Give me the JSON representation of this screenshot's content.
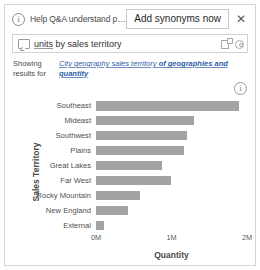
{
  "banner": {
    "info_icon": "info-icon",
    "message": "Help Q&A understand peo...",
    "add_synonyms_label": "Add synonyms now",
    "close_label": "✕"
  },
  "question_box": {
    "lead_icon": "question-box-icon",
    "term_units": "units",
    "term_connector": " by ",
    "term_territory": "sales territory",
    "visual_icon": "visual-type-icon",
    "settings_icon": "gear-icon"
  },
  "showing_results": {
    "label": "Showing results for",
    "phrase_prefix": "City geography sales territory ",
    "phrase_bold": "of geographies and quantity"
  },
  "chart_info_icon": "info-icon",
  "chart_data": {
    "type": "bar",
    "orientation": "horizontal",
    "title": "",
    "xlabel": "Quantity",
    "ylabel": "Sales Territory",
    "categories": [
      "Southeast",
      "Mideast",
      "Southwest",
      "Plains",
      "Great Lakes",
      "Far West",
      "Rocky Mountain",
      "New England",
      "External"
    ],
    "values": [
      1900000,
      1300000,
      1200000,
      1160000,
      870000,
      990000,
      580000,
      420000,
      110000
    ],
    "xlim": [
      0,
      2000000
    ],
    "xticks": [
      0,
      1000000,
      2000000
    ],
    "xticklabels": [
      "0M",
      "1M",
      "2M"
    ],
    "grid": false,
    "legend": false,
    "bar_color": "#a3a3a3"
  }
}
